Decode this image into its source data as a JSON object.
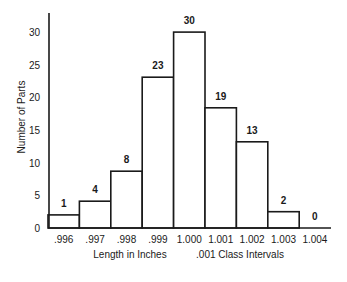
{
  "chart_data": {
    "type": "bar",
    "subtype": "histogram",
    "title": "",
    "xlabel": "Length in Inches",
    "xlabel_note": ".001 Class Intervals",
    "ylabel": "Number of Parts",
    "categories": [
      ".996",
      ".997",
      ".998",
      ".999",
      "1.000",
      "1.001",
      "1.002",
      "1.003",
      "1.004"
    ],
    "values": [
      1,
      4,
      8,
      23,
      30,
      19,
      13,
      2,
      0
    ],
    "value_labels": [
      "1",
      "4",
      "8",
      "23",
      "30",
      "19",
      "13",
      "2",
      "0"
    ],
    "drawn_heights": [
      2,
      4.1,
      8.7,
      23.1,
      30,
      18.4,
      13.2,
      2.5,
      0
    ],
    "yticks": [
      "0",
      "5",
      "10",
      "15",
      "20",
      "25",
      "30"
    ],
    "ylim": [
      0,
      33
    ],
    "grid": false,
    "legend": null,
    "colors": {
      "stroke": "#1a1a1a",
      "fill": "#ffffff"
    }
  }
}
